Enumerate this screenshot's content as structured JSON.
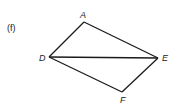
{
  "figure": {
    "part_label": "(f)",
    "vertices": [
      {
        "name": "A",
        "x": 84,
        "y": 22,
        "label_x": 80,
        "label_y": 18
      },
      {
        "name": "D",
        "x": 49,
        "y": 57,
        "label_x": 39,
        "label_y": 61
      },
      {
        "name": "E",
        "x": 158,
        "y": 58,
        "label_x": 162,
        "label_y": 61
      },
      {
        "name": "F",
        "x": 122,
        "y": 92,
        "label_x": 120,
        "label_y": 103
      }
    ],
    "edges": [
      [
        "A",
        "D"
      ],
      [
        "A",
        "E"
      ],
      [
        "D",
        "E"
      ],
      [
        "D",
        "F"
      ],
      [
        "F",
        "E"
      ]
    ],
    "colors": {
      "stroke": "#1a1a1a",
      "text": "#222222",
      "background": "#ffffff"
    }
  }
}
